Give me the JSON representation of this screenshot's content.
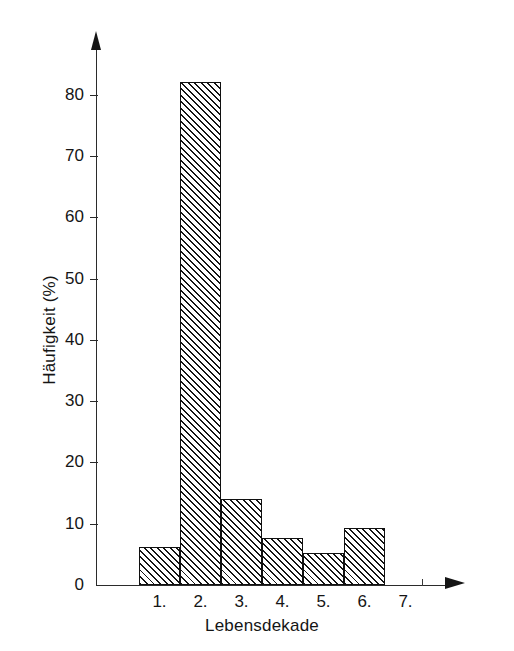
{
  "chart_data": {
    "type": "bar",
    "title": "",
    "subtitle": "",
    "xlabel": "Lebensdekade",
    "ylabel": "Häufigkeit (%)",
    "categories": [
      "1.",
      "2.",
      "3.",
      "4.",
      "5.",
      "6.",
      "7."
    ],
    "values": [
      6.2,
      82.0,
      14.0,
      7.7,
      5.2,
      9.3,
      0
    ],
    "ylim": [
      0,
      88
    ],
    "yticks": [
      0,
      10,
      20,
      30,
      40,
      50,
      60,
      70,
      80
    ],
    "ytick_labels": [
      "0",
      "10",
      "20",
      "30",
      "40",
      "50",
      "60",
      "70",
      "80"
    ],
    "grid": false,
    "legend": null,
    "style": {
      "fill": "hatched-diagonal",
      "bar_edge_color": "#101010",
      "axis_color": "#2b2b2b",
      "background": "#ffffff",
      "axes_have_arrows": true
    },
    "annotations": []
  },
  "axes": {
    "y_title": "Häufigkeit (%)",
    "x_title": "Lebensdekade"
  }
}
